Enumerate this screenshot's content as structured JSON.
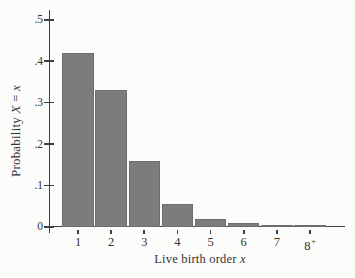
{
  "figure": {
    "background_color": "#fcfcfa"
  },
  "chart_data": {
    "type": "bar",
    "title": "",
    "categories": [
      "1",
      "2",
      "3",
      "4",
      "5",
      "6",
      "7",
      "8+"
    ],
    "values": [
      0.42,
      0.33,
      0.158,
      0.055,
      0.02,
      0.01,
      0.005,
      0.005
    ],
    "xlabel": "Live birth order x",
    "ylabel": "Probability X = x",
    "xlabel_parts": [
      {
        "text": "Live birth order ",
        "italic": false
      },
      {
        "text": "x",
        "italic": true
      }
    ],
    "ylabel_parts": [
      {
        "text": "Probability ",
        "italic": false
      },
      {
        "text": "X",
        "italic": true
      },
      {
        "text": " = ",
        "italic": false
      },
      {
        "text": "x",
        "italic": true
      }
    ],
    "ylim": [
      0,
      0.5
    ],
    "yticks": [
      {
        "value": 0.0,
        "label": "0"
      },
      {
        "value": 0.1,
        "label": ".1"
      },
      {
        "value": 0.2,
        "label": ".2"
      },
      {
        "value": 0.3,
        "label": ".3"
      },
      {
        "value": 0.4,
        "label": ".4"
      },
      {
        "value": 0.5,
        "label": ".5"
      }
    ],
    "grid": false,
    "legend": null,
    "bar_color": "#7c7c7c",
    "bar_border_color": "#6e6e6e",
    "axis_color": "#3f3f3f",
    "text_color": "#333333"
  }
}
